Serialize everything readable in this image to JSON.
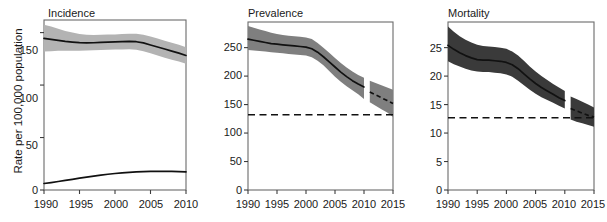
{
  "figure": {
    "width": 607,
    "height": 222,
    "background": "#ffffff",
    "y_axis_label": "Rate per 100,000 population"
  },
  "colors": {
    "axis": "#3c3c3c",
    "frame": "#6b6b6b",
    "line": "#111111",
    "band_incidence": "#b3b3b3",
    "band_prevalence": "#7f7f7f",
    "band_mortality": "#3a3a3a",
    "text": "#1a1a1a"
  },
  "panels": [
    {
      "key": "incidence",
      "title": "Incidence",
      "x_ticks": [
        "1990",
        "1995",
        "2000",
        "2005",
        "2010"
      ],
      "y_ticks": [
        "0",
        "50",
        "100",
        "150"
      ]
    },
    {
      "key": "prevalence",
      "title": "Prevalence",
      "x_ticks": [
        "1990",
        "1995",
        "2000",
        "2005",
        "2010",
        "2015"
      ],
      "y_ticks": [
        "0",
        "50",
        "100",
        "150",
        "200",
        "250"
      ]
    },
    {
      "key": "mortality",
      "title": "Mortality",
      "x_ticks": [
        "1990",
        "1995",
        "2000",
        "2005",
        "2010",
        "2015"
      ],
      "y_ticks": [
        "0",
        "5",
        "10",
        "15",
        "20",
        "25"
      ]
    }
  ],
  "chart_data": [
    {
      "type": "line",
      "panel": "incidence",
      "title": "Incidence",
      "xlabel": "",
      "ylabel": "Rate per 100,000 population",
      "xlim": [
        1990,
        2010
      ],
      "ylim": [
        0,
        162
      ],
      "xticks": [
        1990,
        1995,
        2000,
        2005,
        2010
      ],
      "yticks": [
        0,
        50,
        100,
        150
      ],
      "grid": false,
      "legend": "none",
      "x": [
        1990,
        1991,
        1992,
        1993,
        1994,
        1995,
        1996,
        1997,
        1998,
        1999,
        2000,
        2001,
        2002,
        2003,
        2004,
        2005,
        2006,
        2007,
        2008,
        2009,
        2010
      ],
      "series": [
        {
          "name": "All forms of TB",
          "style": "solid",
          "values": [
            144.5,
            143.6,
            142.6,
            141.7,
            141.0,
            140.4,
            140.2,
            140.3,
            140.6,
            140.9,
            141.1,
            141.4,
            141.6,
            141.3,
            140.2,
            138.2,
            136.3,
            134.4,
            132.4,
            130.4,
            128.2
          ],
          "band_low": [
            132.0,
            132.2,
            132.6,
            132.7,
            132.8,
            132.8,
            132.9,
            133.2,
            133.4,
            133.6,
            133.8,
            134.0,
            134.1,
            133.6,
            132.3,
            130.2,
            128.2,
            126.1,
            124.2,
            122.4,
            120.3
          ],
          "band_high": [
            157.5,
            155.8,
            153.6,
            151.4,
            150.0,
            148.6,
            148.0,
            147.8,
            147.9,
            148.1,
            148.3,
            148.6,
            148.8,
            148.8,
            148.0,
            146.2,
            144.3,
            142.3,
            140.3,
            138.3,
            136.0
          ],
          "band_color": "#b3b3b3"
        },
        {
          "name": "HIV-positive TB",
          "style": "solid",
          "values": [
            6.2,
            7.1,
            8.1,
            9.1,
            10.2,
            11.3,
            12.3,
            13.3,
            14.2,
            15.0,
            15.7,
            16.3,
            16.8,
            17.2,
            17.5,
            17.7,
            17.8,
            17.8,
            17.7,
            17.5,
            17.3
          ],
          "band_low": null,
          "band_high": null,
          "band_color": null
        }
      ]
    },
    {
      "type": "line",
      "panel": "prevalence",
      "title": "Prevalence",
      "xlabel": "",
      "ylabel": "Rate per 100,000 population",
      "xlim": [
        1990,
        2015
      ],
      "ylim": [
        0,
        295
      ],
      "xticks": [
        1990,
        1995,
        2000,
        2005,
        2010,
        2015
      ],
      "yticks": [
        0,
        50,
        100,
        150,
        200,
        250
      ],
      "grid": false,
      "legend": "none",
      "x": [
        1990,
        1991,
        1992,
        1993,
        1994,
        1995,
        1996,
        1997,
        1998,
        1999,
        2000,
        2001,
        2002,
        2003,
        2004,
        2005,
        2006,
        2007,
        2008,
        2009,
        2010
      ],
      "series": [
        {
          "name": "Prevalence (estimated)",
          "style": "solid",
          "values": [
            265,
            263,
            261,
            259,
            257,
            256,
            255,
            254,
            253,
            252,
            251,
            248,
            242,
            234,
            225,
            216,
            207,
            199,
            192,
            186,
            181
          ],
          "band_low": [
            246,
            245,
            244,
            243,
            242,
            241,
            240,
            239,
            238,
            237,
            236,
            233,
            227,
            219,
            209,
            199,
            190,
            182,
            175,
            168,
            160
          ],
          "band_high": [
            288,
            285,
            282,
            279,
            276,
            274,
            272,
            271,
            270,
            269,
            268,
            265,
            258,
            250,
            241,
            232,
            223,
            215,
            208,
            202,
            197
          ],
          "band_color": "#7f7f7f"
        },
        {
          "name": "Prevalence (projected)",
          "style": "dashed",
          "x": [
            2011,
            2012,
            2013,
            2014,
            2015
          ],
          "values": [
            172,
            167,
            162,
            157,
            152
          ],
          "band_low": [
            154,
            148,
            142,
            136,
            128
          ],
          "band_high": [
            192,
            188,
            184,
            180,
            176
          ],
          "band_color": "#7f7f7f"
        }
      ],
      "reference_line": {
        "label": "2015 target (half of 1990)",
        "value": 132,
        "style": "dashed"
      }
    },
    {
      "type": "line",
      "panel": "mortality",
      "title": "Mortality",
      "xlabel": "",
      "ylabel": "Rate per 100,000 population",
      "xlim": [
        1990,
        2015
      ],
      "ylim": [
        0,
        29.5
      ],
      "xticks": [
        1990,
        1995,
        2000,
        2005,
        2010,
        2015
      ],
      "yticks": [
        0,
        5,
        10,
        15,
        20,
        25
      ],
      "grid": false,
      "legend": "none",
      "x": [
        1990,
        1991,
        1992,
        1993,
        1994,
        1995,
        1996,
        1997,
        1998,
        1999,
        2000,
        2001,
        2002,
        2003,
        2004,
        2005,
        2006,
        2007,
        2008,
        2009,
        2010
      ],
      "series": [
        {
          "name": "Mortality (estimated)",
          "style": "solid",
          "values": [
            25.4,
            24.7,
            24.1,
            23.6,
            23.2,
            22.9,
            22.8,
            22.8,
            22.7,
            22.6,
            22.4,
            22.0,
            21.3,
            20.4,
            19.5,
            18.7,
            18.0,
            17.4,
            16.8,
            16.2,
            15.7
          ],
          "band_low": [
            22.6,
            22.1,
            21.7,
            21.3,
            21.0,
            20.8,
            20.7,
            20.7,
            20.6,
            20.5,
            20.3,
            19.9,
            19.2,
            18.4,
            17.6,
            16.9,
            16.3,
            15.8,
            15.3,
            14.8,
            14.3
          ],
          "band_high": [
            28.7,
            27.8,
            27.0,
            26.4,
            25.9,
            25.5,
            25.3,
            25.2,
            25.1,
            25.0,
            24.8,
            24.3,
            23.6,
            22.7,
            21.7,
            20.8,
            20.0,
            19.3,
            18.6,
            18.0,
            17.4
          ],
          "band_color": "#3a3a3a"
        },
        {
          "name": "Mortality (projected)",
          "style": "dashed",
          "x": [
            2011,
            2012,
            2013,
            2014,
            2015
          ],
          "values": [
            14.3,
            13.9,
            13.5,
            13.1,
            12.8
          ],
          "band_low": [
            12.4,
            12.0,
            11.7,
            11.4,
            11.1
          ],
          "band_high": [
            16.4,
            16.0,
            15.5,
            15.0,
            14.5
          ],
          "band_color": "#3a3a3a"
        }
      ],
      "reference_line": {
        "label": "2015 target (half of 1990)",
        "value": 12.7,
        "style": "dashed"
      }
    }
  ]
}
